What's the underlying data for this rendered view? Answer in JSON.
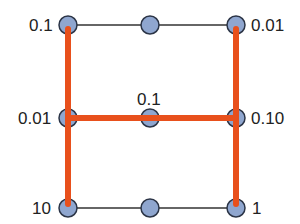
{
  "diagram": {
    "colors": {
      "path": "#e8501c",
      "node_fill": "#8fa6cf",
      "node_stroke": "#2b3446",
      "edge": "#333333"
    },
    "nodes": [
      {
        "id": "tl",
        "label": "0.1"
      },
      {
        "id": "tm",
        "label": ""
      },
      {
        "id": "tr",
        "label": "0.01"
      },
      {
        "id": "ml",
        "label": "0.01"
      },
      {
        "id": "mm",
        "label": "0.1"
      },
      {
        "id": "mr",
        "label": "0.10"
      },
      {
        "id": "bl",
        "label": "10"
      },
      {
        "id": "bm",
        "label": ""
      },
      {
        "id": "br",
        "label": "1"
      }
    ],
    "highlighted_path": [
      "tl-ml",
      "ml-bl",
      "ml-mm",
      "mm-mr",
      "tr-mr",
      "mr-br"
    ],
    "plain_edges": [
      "tl-tm",
      "tm-tr",
      "bl-bm",
      "bm-br"
    ]
  }
}
